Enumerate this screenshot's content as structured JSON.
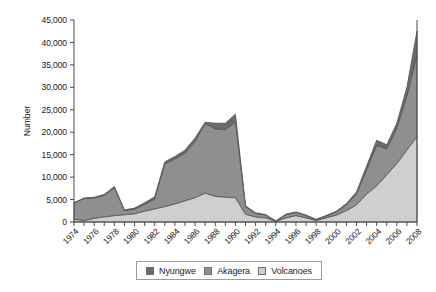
{
  "chart_data": {
    "type": "area",
    "stacked": true,
    "title": "",
    "xlabel": "",
    "ylabel": "Number",
    "ylim": [
      0,
      45000
    ],
    "ytick_step": 5000,
    "ytick_labels": [
      "0",
      "5,000",
      "10,000",
      "15,000",
      "20,000",
      "25,000",
      "30,000",
      "35,000",
      "40,000",
      "45,000"
    ],
    "ytick_values": [
      0,
      5000,
      10000,
      15000,
      20000,
      25000,
      30000,
      35000,
      40000,
      45000
    ],
    "grid": false,
    "legend_position": "bottom",
    "x": [
      1974,
      1975,
      1976,
      1977,
      1978,
      1979,
      1980,
      1981,
      1982,
      1983,
      1984,
      1985,
      1986,
      1987,
      1988,
      1989,
      1990,
      1991,
      1992,
      1993,
      1994,
      1995,
      1996,
      1997,
      1998,
      1999,
      2000,
      2001,
      2002,
      2003,
      2004,
      2005,
      2006,
      2007,
      2008
    ],
    "xtick_labels": [
      "1974",
      "1976",
      "1978",
      "1980",
      "1982",
      "1984",
      "1986",
      "1988",
      "1990",
      "1992",
      "1994",
      "1996",
      "1998",
      "2000",
      "2002",
      "2004",
      "2006",
      "2008"
    ],
    "xtick_values": [
      1974,
      1976,
      1978,
      1980,
      1982,
      1984,
      1986,
      1988,
      1990,
      1992,
      1994,
      1996,
      1998,
      2000,
      2002,
      2004,
      2006,
      2008
    ],
    "series": [
      {
        "name": "Volcanoes",
        "color": "#cfcfcf",
        "values": [
          600,
          300,
          800,
          1100,
          1400,
          1600,
          1800,
          2400,
          2900,
          3400,
          4000,
          4700,
          5400,
          6400,
          5700,
          5500,
          5400,
          1700,
          1100,
          900,
          100,
          900,
          1400,
          900,
          300,
          900,
          1500,
          2500,
          3800,
          6200,
          8000,
          10500,
          13000,
          16000,
          19000
        ]
      },
      {
        "name": "Akagera",
        "color": "#8f8f8f",
        "values": [
          3600,
          4900,
          4500,
          4800,
          6200,
          900,
          1000,
          1500,
          2200,
          9500,
          10000,
          10600,
          12500,
          15500,
          15000,
          15000,
          16800,
          1700,
          800,
          600,
          100,
          700,
          700,
          500,
          200,
          400,
          700,
          1300,
          2400,
          5300,
          9000,
          5800,
          7800,
          12000,
          18000
        ]
      },
      {
        "name": "Nyungwe",
        "color": "#6b6b6b",
        "values": [
          100,
          150,
          200,
          250,
          300,
          200,
          300,
          400,
          500,
          500,
          600,
          700,
          800,
          300,
          1300,
          1500,
          1800,
          200,
          150,
          150,
          50,
          150,
          150,
          150,
          100,
          150,
          200,
          300,
          500,
          900,
          1200,
          900,
          1200,
          2000,
          5500
        ]
      }
    ]
  },
  "legend": {
    "items": [
      {
        "label": "Nyungwe",
        "color": "#6b6b6b"
      },
      {
        "label": "Akagera",
        "color": "#8f8f8f"
      },
      {
        "label": "Volcanoes",
        "color": "#cfcfcf"
      }
    ]
  }
}
